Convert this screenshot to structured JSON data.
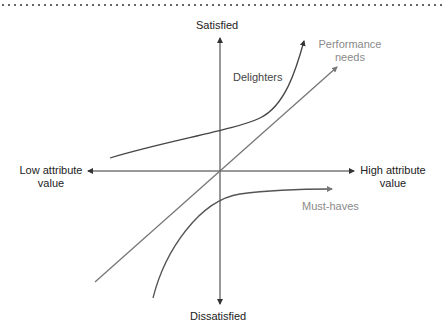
{
  "diagram": {
    "type": "kano-model",
    "axes": {
      "y_top": "Satisfied",
      "y_bottom": "Dissatisfied",
      "x_left_line1": "Low attribute",
      "x_left_line2": "value",
      "x_right_line1": "High attribute",
      "x_right_line2": "value"
    },
    "curves": [
      {
        "name": "Delighters",
        "label": "Delighters",
        "shape": "exponential-up"
      },
      {
        "name": "Performance needs",
        "label_line1": "Performance",
        "label_line2": "needs",
        "shape": "linear"
      },
      {
        "name": "Must-haves",
        "label": "Must-haves",
        "shape": "logarithmic-saturating"
      }
    ],
    "colors": {
      "axis": "#333333",
      "delighters": "#444444",
      "performance": "#777777",
      "musthaves": "#555555",
      "label_dark": "#222222",
      "label_grey": "#8a8a8a"
    }
  }
}
